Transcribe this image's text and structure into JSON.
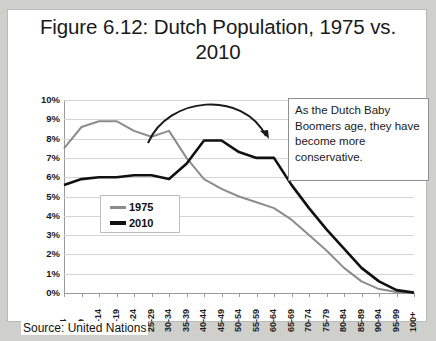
{
  "figure": {
    "title": "Figure 6.12: Dutch Population, 1975 vs. 2010",
    "source": "Source: United Nations",
    "annotation": "As the Dutch Baby Boomers age, they have become more conservative.",
    "colors": {
      "series_1975": "#8c8c8c",
      "series_2010": "#111111",
      "grid": "#d4d4d4",
      "frame": "#b9b9b9"
    }
  },
  "chart_data": {
    "type": "line",
    "title": "Figure 6.12: Dutch Population, 1975 vs. 2010",
    "xlabel": "",
    "ylabel": "",
    "ylim": [
      0,
      10
    ],
    "ytick_labels": [
      "0%",
      "1%",
      "2%",
      "3%",
      "4%",
      "5%",
      "6%",
      "7%",
      "8%",
      "9%",
      "10%"
    ],
    "grid": true,
    "legend_position": "inside-left",
    "categories": [
      "0-4",
      "5-9",
      "10-14",
      "15-19",
      "20-24",
      "25-29",
      "30-34",
      "35-39",
      "40-44",
      "45-49",
      "50-54",
      "55-59",
      "60-64",
      "65-69",
      "70-74",
      "75-79",
      "80-84",
      "85-89",
      "90-94",
      "95-99",
      "100+"
    ],
    "series": [
      {
        "name": "1975",
        "color": "#8c8c8c",
        "values": [
          7.5,
          8.6,
          8.9,
          8.9,
          8.4,
          8.1,
          8.4,
          7.0,
          5.9,
          5.4,
          5.0,
          4.7,
          4.4,
          3.8,
          3.0,
          2.2,
          1.3,
          0.6,
          0.2,
          0.05,
          0.0
        ]
      },
      {
        "name": "2010",
        "color": "#111111",
        "values": [
          5.6,
          5.9,
          6.0,
          6.0,
          6.1,
          6.1,
          5.9,
          6.7,
          7.9,
          7.9,
          7.3,
          7.0,
          7.0,
          5.6,
          4.4,
          3.3,
          2.3,
          1.3,
          0.6,
          0.15,
          0.02
        ]
      }
    ]
  },
  "legend": {
    "items": [
      {
        "label": "1975"
      },
      {
        "label": "2010"
      }
    ]
  }
}
